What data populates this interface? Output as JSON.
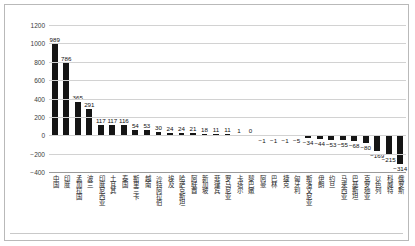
{
  "chart_data": {
    "type": "bar",
    "title": "",
    "xlabel": "",
    "ylabel": "",
    "ylim": [
      -400,
      1200
    ],
    "ytick_step": 200,
    "yticks": [
      1200,
      1000,
      800,
      600,
      400,
      200,
      0,
      -200,
      -400
    ],
    "grid": true,
    "legend": "none",
    "bar_color": "#151515",
    "categories": [
      "中国",
      "印度",
      "孟加拉国",
      "波兰",
      "印度尼西亚",
      "土耳其",
      "泰国",
      "斯里兰卡",
      "越南",
      "沙特阿拉伯",
      "埃及",
      "哈萨克斯坦",
      "阿联酋",
      "新加坡",
      "菲律宾",
      "罗马尼亚",
      "卡塔尔",
      "黎巴嫩",
      "阿曼",
      "巴林",
      "捷克",
      "匈牙利",
      "斯洛文尼亚",
      "伊朗",
      "约旦",
      "马来西亚",
      "巴基斯坦",
      "克罗地亚",
      "以色列",
      "科威特",
      "俄罗斯"
    ],
    "values": [
      989,
      786,
      365,
      291,
      117,
      117,
      116,
      54,
      53,
      30,
      24,
      24,
      21,
      18,
      11,
      11,
      1,
      0,
      -1,
      -1,
      -1,
      -5,
      -34,
      -44,
      -53,
      -55,
      -68,
      -80,
      -169,
      -215,
      -314
    ],
    "value_labels": [
      "989",
      "786",
      "365",
      "291",
      "117",
      "117",
      "116",
      "54",
      "53",
      "30",
      "24",
      "24",
      "21",
      "18",
      "11",
      "11",
      "1",
      "0",
      "-1",
      "-1",
      "-1",
      "-5",
      "-34",
      "-44",
      "-53",
      "-55",
      "-68",
      "-80",
      "-169",
      "-215",
      "-314"
    ]
  }
}
